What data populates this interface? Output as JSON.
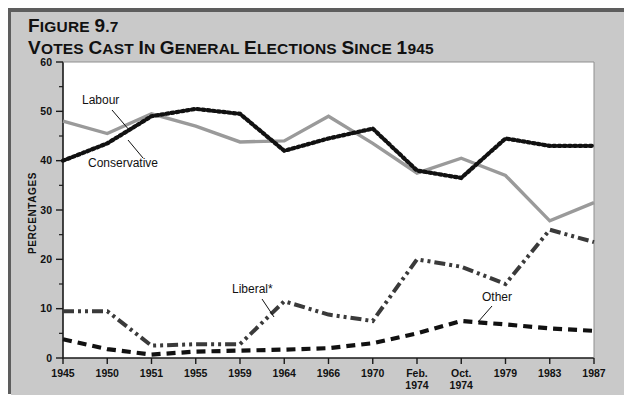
{
  "figure": {
    "number_label": "FIGURE 9.7",
    "title": "VOTES CAST IN GENERAL ELECTIONS SINCE 1945"
  },
  "colors": {
    "panel_background": "#c9c9c9",
    "plot_background": "#ffffff",
    "axis": "#1a1a1a",
    "labour": "#9a9a9a",
    "conservative": "#111111",
    "liberal": "#3a3a3a",
    "other": "#111111"
  },
  "axes": {
    "y_title": "PERCENTAGES",
    "y_min": 0,
    "y_max": 60,
    "y_major_step": 10,
    "y_minor_step": 5,
    "y_tick_labels": [
      "0",
      "10",
      "20",
      "30",
      "40",
      "50",
      "60"
    ],
    "x_tick_labels": [
      {
        "line1": "1945",
        "line2": ""
      },
      {
        "line1": "1950",
        "line2": ""
      },
      {
        "line1": "1951",
        "line2": ""
      },
      {
        "line1": "1955",
        "line2": ""
      },
      {
        "line1": "1959",
        "line2": ""
      },
      {
        "line1": "1964",
        "line2": ""
      },
      {
        "line1": "1966",
        "line2": ""
      },
      {
        "line1": "1970",
        "line2": ""
      },
      {
        "line1": "Feb.",
        "line2": "1974"
      },
      {
        "line1": "Oct.",
        "line2": "1974"
      },
      {
        "line1": "1979",
        "line2": ""
      },
      {
        "line1": "1983",
        "line2": ""
      },
      {
        "line1": "1987",
        "line2": ""
      }
    ]
  },
  "annotations": [
    {
      "name": "labour",
      "text": "Labour",
      "x": 82,
      "y": 104
    },
    {
      "name": "conservative",
      "text": "Conservative",
      "x": 88,
      "y": 167
    },
    {
      "name": "liberal",
      "text": "Liberal*",
      "x": 232,
      "y": 293
    },
    {
      "name": "other",
      "text": "Other",
      "x": 482,
      "y": 301
    }
  ],
  "chart_data": {
    "type": "line",
    "title": "VOTES CAST IN GENERAL ELECTIONS SINCE 1945",
    "xlabel": "",
    "ylabel": "PERCENTAGES",
    "ylim": [
      0,
      60
    ],
    "grid": false,
    "legend": "inline-annotations",
    "categories": [
      "1945",
      "1950",
      "1951",
      "1955",
      "1959",
      "1964",
      "1966",
      "1970",
      "Feb. 1974",
      "Oct. 1974",
      "1979",
      "1983",
      "1987"
    ],
    "series": [
      {
        "name": "Labour",
        "style": "solid",
        "color": "#9a9a9a",
        "values": [
          48.0,
          45.5,
          49.5,
          47.0,
          43.8,
          44.0,
          49.0,
          43.5,
          37.5,
          40.5,
          37.0,
          27.8,
          31.5
        ]
      },
      {
        "name": "Conservative",
        "style": "dotted",
        "color": "#111111",
        "values": [
          40.0,
          43.5,
          49.0,
          50.5,
          49.5,
          42.0,
          44.5,
          46.5,
          38.0,
          36.5,
          44.5,
          43.0,
          43.0
        ]
      },
      {
        "name": "Liberal*",
        "style": "dash-dot-dot",
        "color": "#3a3a3a",
        "values": [
          9.5,
          9.5,
          2.5,
          2.8,
          2.8,
          11.5,
          8.8,
          7.5,
          20.0,
          18.5,
          15.0,
          26.0,
          23.5
        ]
      },
      {
        "name": "Other",
        "style": "dashed",
        "color": "#111111",
        "values": [
          3.8,
          1.8,
          0.7,
          1.3,
          1.5,
          1.7,
          2.0,
          3.0,
          5.0,
          7.5,
          6.8,
          6.0,
          5.5
        ]
      }
    ],
    "footnote_marker": "*"
  }
}
